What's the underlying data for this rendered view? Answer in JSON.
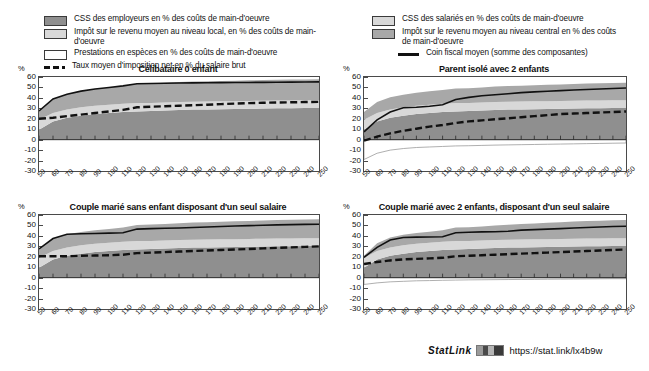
{
  "legend_left": {
    "items": [
      {
        "icon": "swatch-dark",
        "label": "CSS des employeurs en % des coûts de main-d'oeuvre",
        "color": "#8f8f8f"
      },
      {
        "icon": "swatch-light",
        "label": "Impôt sur le revenu moyen au niveau local, en % des coûts de main-d'oeuvre",
        "color": "#d8d8d8"
      },
      {
        "icon": "swatch-white",
        "label": "Prestations en espèces en % des coûts de main-d'oeuvre",
        "color": "#ffffff"
      },
      {
        "icon": "dashed-line",
        "label": "Taux moyen d'imposition net en % du salaire brut",
        "color": "#111111"
      }
    ]
  },
  "legend_right": {
    "items": [
      {
        "icon": "swatch-light",
        "label": "CSS des salariés en % des coûts de main-d'oeuvre",
        "color": "#d8d8d8"
      },
      {
        "icon": "swatch-mid",
        "label": "Impôt sur le revenu moyen au niveau central en % des coûts de main-d'oeuvre",
        "color": "#a8a8a8"
      },
      {
        "icon": "solid-line",
        "label": "Coin fiscal moyen (somme des composantes)",
        "color": "#111111"
      }
    ]
  },
  "axis": {
    "y_unit": "%",
    "y_ticks": [
      60,
      50,
      40,
      30,
      20,
      10,
      0,
      -10,
      -20,
      -30
    ],
    "ylim": [
      -30,
      60
    ],
    "x_ticks": [
      50,
      60,
      70,
      80,
      90,
      100,
      110,
      120,
      130,
      140,
      150,
      160,
      170,
      180,
      190,
      200,
      210,
      220,
      230,
      240,
      250
    ],
    "xlim": [
      50,
      250
    ]
  },
  "statlink": {
    "word": "StatLink",
    "glyph": "barcode-icon",
    "url": "https://stat.link/lx4b9w"
  },
  "colors": {
    "employer_ssc": "#8f8f8f",
    "central_income_tax": "#a8a8a8",
    "employee_ssc": "#d8d8d8",
    "local_income_tax": "#e8e8e8",
    "cash_benefits": "#ffffff",
    "net_avg_tax_rate": "#111111",
    "avg_tax_wedge": "#111111",
    "axis": "#4a4a4a"
  },
  "chart_data": [
    {
      "id": "celibataire-0-enfant",
      "type": "area",
      "title": "Célibataire 0 enfant",
      "xlabel": "",
      "ylabel": "%",
      "xlim": [
        50,
        250
      ],
      "ylim": [
        -30,
        60
      ],
      "grid": false,
      "x": [
        50,
        60,
        70,
        80,
        90,
        100,
        110,
        120,
        130,
        140,
        150,
        160,
        170,
        180,
        190,
        200,
        210,
        220,
        230,
        240,
        250
      ],
      "series": [
        {
          "name": "CSS des employeurs en % des coûts de main-d'oeuvre",
          "stack": "tax",
          "values": [
            9.5,
            17.5,
            21.0,
            23.0,
            24.5,
            25.5,
            26.5,
            27.0,
            27.5,
            28.0,
            28.5,
            28.8,
            29.0,
            29.2,
            29.4,
            29.6,
            29.8,
            30.0,
            30.1,
            30.2,
            30.3
          ]
        },
        {
          "name": "CSS des salariés en % des coûts de main-d'oeuvre",
          "stack": "tax",
          "values": [
            9.5,
            8.0,
            8.0,
            8.0,
            8.0,
            8.0,
            8.0,
            8.0,
            7.5,
            7.5,
            7.5,
            7.5,
            7.5,
            7.5,
            7.5,
            7.5,
            7.5,
            7.5,
            7.5,
            7.5,
            7.5
          ]
        },
        {
          "name": "Impôt sur le revenu moyen au niveau central en % des coûts de main-d'oeuvre",
          "stack": "tax",
          "values": [
            8.5,
            13.5,
            14.5,
            15.5,
            16.0,
            16.5,
            17.0,
            18.5,
            18.8,
            19.0,
            19.2,
            19.3,
            19.4,
            19.5,
            19.6,
            19.7,
            19.8,
            19.9,
            20.0,
            20.0,
            20.0
          ]
        },
        {
          "name": "Impôt sur le revenu moyen au niveau local, en % des coûts de main-d'oeuvre",
          "stack": "tax",
          "values": [
            0,
            0,
            0,
            0,
            0,
            0,
            0,
            0,
            0,
            0,
            0,
            0,
            0,
            0,
            0,
            0,
            0,
            0,
            0,
            0,
            0
          ]
        },
        {
          "name": "Prestations en espèces en % des coûts de main-d'oeuvre",
          "stack": "benefit",
          "values": [
            0,
            0,
            0,
            0,
            0,
            0,
            0,
            0,
            0,
            0,
            0,
            0,
            0,
            0,
            0,
            0,
            0,
            0,
            0,
            0,
            0
          ]
        }
      ],
      "lines": [
        {
          "name": "Coin fiscal moyen (somme des composantes)",
          "style": "solid",
          "values": [
            27.5,
            39.0,
            43.5,
            46.5,
            48.5,
            50.0,
            51.5,
            53.5,
            53.8,
            54.0,
            54.2,
            54.4,
            54.5,
            54.6,
            54.7,
            54.8,
            54.9,
            55.0,
            55.1,
            55.2,
            55.3
          ]
        },
        {
          "name": "Taux moyen d'imposition net en % du salaire brut",
          "style": "dashed",
          "values": [
            20.0,
            21.0,
            22.5,
            24.0,
            25.5,
            27.0,
            28.5,
            31.0,
            31.5,
            32.0,
            32.5,
            33.0,
            33.5,
            34.0,
            34.5,
            35.0,
            35.3,
            35.6,
            35.8,
            36.0,
            36.2
          ]
        }
      ]
    },
    {
      "id": "parent-isole-2-enfants",
      "type": "area",
      "title": "Parent isolé avec 2 enfants",
      "xlabel": "",
      "ylabel": "%",
      "xlim": [
        50,
        250
      ],
      "ylim": [
        -30,
        60
      ],
      "grid": false,
      "x": [
        50,
        60,
        70,
        80,
        90,
        100,
        110,
        120,
        130,
        140,
        150,
        160,
        170,
        180,
        190,
        200,
        210,
        220,
        230,
        240,
        250
      ],
      "series": [
        {
          "name": "CSS des employeurs en % des coûts de main-d'oeuvre",
          "stack": "tax",
          "values": [
            9.5,
            17.5,
            21.0,
            23.0,
            24.5,
            25.5,
            26.5,
            27.0,
            27.5,
            28.0,
            28.5,
            28.8,
            29.0,
            29.2,
            29.4,
            29.6,
            29.8,
            30.0,
            30.1,
            30.2,
            30.3
          ]
        },
        {
          "name": "CSS des salariés en % des coûts de main-d'oeuvre",
          "stack": "tax",
          "values": [
            9.5,
            8.0,
            8.0,
            8.0,
            8.0,
            8.0,
            8.0,
            8.0,
            7.5,
            7.5,
            7.5,
            7.5,
            7.5,
            7.5,
            7.5,
            7.5,
            7.5,
            7.5,
            7.5,
            7.5,
            7.5
          ]
        },
        {
          "name": "Impôt sur le revenu moyen au niveau central en % des coûts de main-d'oeuvre",
          "stack": "tax",
          "values": [
            7.5,
            10.5,
            11.5,
            12.0,
            12.5,
            12.8,
            13.0,
            14.0,
            14.2,
            14.5,
            14.8,
            15.0,
            15.2,
            15.4,
            15.6,
            15.8,
            16.0,
            16.2,
            16.4,
            16.5,
            16.6
          ]
        },
        {
          "name": "Impôt sur le revenu moyen au niveau local, en % des coûts de main-d'oeuvre",
          "stack": "tax",
          "values": [
            0,
            0,
            0,
            0,
            0,
            0,
            0,
            0,
            0,
            0,
            0,
            0,
            0,
            0,
            0,
            0,
            0,
            0,
            0,
            0,
            0
          ]
        },
        {
          "name": "Prestations en espèces en % des coûts de main-d'oeuvre",
          "stack": "benefit",
          "values": [
            -19.0,
            -13.0,
            -10.0,
            -8.5,
            -7.5,
            -7.0,
            -6.5,
            -6.0,
            -5.8,
            -5.5,
            -5.2,
            -5.0,
            -4.8,
            -4.6,
            -4.4,
            -4.2,
            -4.0,
            -3.8,
            -3.6,
            -3.4,
            -3.2
          ]
        }
      ],
      "lines": [
        {
          "name": "Coin fiscal moyen (somme des composantes)",
          "style": "solid",
          "values": [
            7.5,
            19.0,
            26.5,
            30.5,
            31.0,
            32.0,
            33.5,
            38.5,
            40.5,
            42.0,
            43.0,
            44.0,
            45.0,
            45.8,
            46.4,
            47.0,
            47.5,
            48.0,
            48.5,
            49.0,
            49.5
          ]
        },
        {
          "name": "Taux moyen d'imposition net en % du salaire brut",
          "style": "dashed",
          "values": [
            -1.0,
            3.0,
            6.0,
            8.5,
            10.5,
            12.5,
            14.0,
            16.0,
            17.5,
            18.5,
            19.5,
            20.5,
            21.5,
            22.5,
            23.5,
            24.5,
            25.0,
            25.5,
            26.0,
            26.5,
            27.0
          ]
        }
      ]
    },
    {
      "id": "couple-marie-sans-enfant",
      "type": "area",
      "title": "Couple marié sans enfant disposant d'un seul salaire",
      "xlabel": "",
      "ylabel": "%",
      "xlim": [
        50,
        250
      ],
      "ylim": [
        -30,
        60
      ],
      "grid": false,
      "x": [
        50,
        60,
        70,
        80,
        90,
        100,
        110,
        120,
        130,
        140,
        150,
        160,
        170,
        180,
        190,
        200,
        210,
        220,
        230,
        240,
        250
      ],
      "series": [
        {
          "name": "CSS des employeurs en % des coûts de main-d'oeuvre",
          "stack": "tax",
          "values": [
            9.5,
            17.5,
            21.0,
            23.0,
            24.5,
            25.5,
            26.5,
            27.0,
            27.5,
            28.0,
            28.5,
            28.8,
            29.0,
            29.2,
            29.4,
            29.6,
            29.8,
            30.0,
            30.1,
            30.2,
            30.3
          ]
        },
        {
          "name": "CSS des salariés en % des coûts de main-d'oeuvre",
          "stack": "tax",
          "values": [
            9.5,
            8.0,
            8.0,
            8.0,
            8.0,
            8.0,
            8.0,
            8.0,
            7.5,
            7.5,
            7.5,
            7.5,
            7.5,
            7.5,
            7.5,
            7.5,
            7.5,
            7.5,
            7.5,
            7.5,
            7.5
          ]
        },
        {
          "name": "Impôt sur le revenu moyen au niveau central en % des coûts de main-d'oeuvre",
          "stack": "tax",
          "values": [
            8.5,
            12.0,
            12.5,
            12.8,
            13.0,
            13.2,
            13.5,
            15.5,
            15.8,
            16.0,
            16.2,
            16.4,
            16.6,
            16.8,
            17.0,
            17.2,
            17.4,
            17.6,
            17.8,
            18.0,
            18.2
          ]
        },
        {
          "name": "Impôt sur le revenu moyen au niveau local, en % des coûts de main-d'oeuvre",
          "stack": "tax",
          "values": [
            0,
            0,
            0,
            0,
            0,
            0,
            0,
            0,
            0,
            0,
            0,
            0,
            0,
            0,
            0,
            0,
            0,
            0,
            0,
            0,
            0
          ]
        },
        {
          "name": "Prestations en espèces en % des coûts de main-d'oeuvre",
          "stack": "benefit",
          "values": [
            0,
            0,
            0,
            0,
            0,
            0,
            0,
            0,
            0,
            0,
            0,
            0,
            0,
            0,
            0,
            0,
            0,
            0,
            0,
            0,
            0
          ]
        }
      ],
      "lines": [
        {
          "name": "Coin fiscal moyen (somme des composantes)",
          "style": "solid",
          "values": [
            27.5,
            37.5,
            41.5,
            42.0,
            42.3,
            42.6,
            43.0,
            46.5,
            47.0,
            47.3,
            47.6,
            48.0,
            48.5,
            49.0,
            49.4,
            49.8,
            50.2,
            50.5,
            50.8,
            51.0,
            51.2
          ]
        },
        {
          "name": "Taux moyen d'imposition net en % du salaire brut",
          "style": "dashed",
          "values": [
            20.5,
            20.5,
            20.5,
            21.0,
            21.2,
            21.5,
            22.0,
            23.5,
            24.0,
            24.5,
            25.0,
            25.5,
            26.0,
            26.5,
            27.0,
            27.5,
            28.0,
            28.5,
            29.0,
            29.5,
            30.0
          ]
        }
      ]
    },
    {
      "id": "couple-marie-2-enfants",
      "type": "area",
      "title": "Couple marié avec 2 enfants, disposant d'un seul salaire",
      "xlabel": "",
      "ylabel": "%",
      "xlim": [
        50,
        250
      ],
      "ylim": [
        -30,
        60
      ],
      "grid": false,
      "x": [
        50,
        60,
        70,
        80,
        90,
        100,
        110,
        120,
        130,
        140,
        150,
        160,
        170,
        180,
        190,
        200,
        210,
        220,
        230,
        240,
        250
      ],
      "series": [
        {
          "name": "CSS des employeurs en % des coûts de main-d'oeuvre",
          "stack": "tax",
          "values": [
            9.5,
            17.5,
            21.0,
            23.0,
            24.5,
            25.5,
            26.5,
            27.0,
            27.5,
            28.0,
            28.5,
            28.8,
            29.0,
            29.2,
            29.4,
            29.6,
            29.8,
            30.0,
            30.1,
            30.2,
            30.3
          ]
        },
        {
          "name": "CSS des salariés en % des coûts de main-d'oeuvre",
          "stack": "tax",
          "values": [
            9.5,
            8.0,
            8.0,
            8.0,
            8.0,
            8.0,
            8.0,
            8.0,
            7.5,
            7.5,
            7.5,
            7.5,
            7.5,
            7.5,
            7.5,
            7.5,
            7.5,
            7.5,
            7.5,
            7.5,
            7.5
          ]
        },
        {
          "name": "Impôt sur le revenu moyen au niveau central en % des coûts de main-d'oeuvre",
          "stack": "tax",
          "values": [
            2.0,
            7.5,
            9.5,
            10.0,
            10.3,
            10.5,
            10.8,
            13.0,
            13.3,
            13.6,
            14.0,
            14.4,
            14.8,
            15.2,
            15.6,
            16.0,
            16.4,
            16.8,
            17.0,
            17.2,
            17.4
          ]
        },
        {
          "name": "Impôt sur le revenu moyen au niveau local, en % des coûts de main-d'oeuvre",
          "stack": "tax",
          "values": [
            0,
            0,
            0,
            0,
            0,
            0,
            0,
            0,
            0,
            0,
            0,
            0,
            0,
            0,
            0,
            0,
            0,
            0,
            0,
            0,
            0
          ]
        },
        {
          "name": "Prestations en espèces en % des coûts de main-d'oeuvre",
          "stack": "benefit",
          "values": [
            -6.5,
            -5.0,
            -4.0,
            -3.5,
            -3.0,
            -2.8,
            -2.5,
            -2.3,
            -2.1,
            -2.0,
            -1.9,
            -1.8,
            -1.7,
            -1.6,
            -1.5,
            -1.4,
            -1.3,
            -1.2,
            -1.1,
            -1.0,
            -1.0
          ]
        }
      ],
      "lines": [
        {
          "name": "Coin fiscal moyen (somme des composantes)",
          "style": "solid",
          "values": [
            19.5,
            29.0,
            36.0,
            38.5,
            38.8,
            39.0,
            39.2,
            43.0,
            43.5,
            43.8,
            44.0,
            44.5,
            45.5,
            46.0,
            46.5,
            47.0,
            47.5,
            48.0,
            48.5,
            49.0,
            49.2
          ]
        },
        {
          "name": "Taux moyen d'imposition net en % du salaire brut",
          "style": "dashed",
          "values": [
            13.0,
            15.0,
            16.5,
            17.5,
            18.0,
            18.5,
            19.0,
            20.5,
            21.0,
            21.5,
            22.0,
            22.5,
            23.0,
            23.5,
            24.0,
            24.5,
            25.0,
            25.5,
            26.0,
            26.5,
            27.0
          ]
        }
      ]
    }
  ]
}
